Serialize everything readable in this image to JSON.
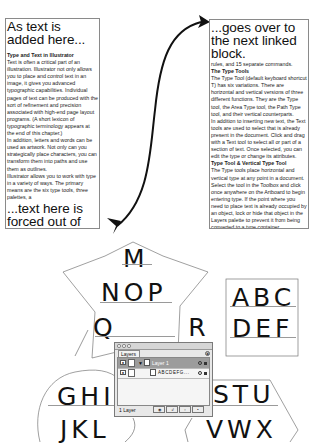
{
  "left_box": {
    "heading": "As text is added here...",
    "section_title": "Type and Text in Illustrator",
    "body": "Text is often a critical part of an illustration. Illustrator not only allows you to place and control text in an image, it gives you advanced typographic capabilities. Individual pages of text can be produced with the sort of refinement and precision associated with high-end page layout programs. (A short lexicon of typographic terminology appears at the end of this chapter.)",
    "body2": "In addition, letters and words can be used as artwork. Not only can you strategically place characters, you can transform them into paths and use them as outlines.",
    "body3": "Illustrator allows you to work with type in a variety of ways. The primary means are the six type tools, three palettes, a",
    "overflow": "...text here is forced out of the container and ..."
  },
  "right_box": {
    "heading": "...goes over to the next linked block.",
    "intro": "rules, and 15 separate commands.",
    "section1_title": "The Type Tools",
    "section1_body": "The Type Tool (default keyboard shortcut T) has six variations. There are horizontal and vertical versions of three different functions. They are the Type tool, the Area Type tool, the Path Type tool, and their vertical counterparts.",
    "section1_body2": "In addition to inserting new text, the Text tools are used to select that is already present in the document. Click and drag with a Text tool to select all or part of a section of text. Once selected, you can edit the type or change its attributes.",
    "section2_title": "Type Tool & Vertical Type Tool",
    "section2_body": "The Type tools place horizontal and vertical type at any point in a document. Select the tool in the Toolbox and click once anywhere on the Artboard to begin entering type. If the point where you need to place text is already occupied by an object, lock or hide that object in the Layers palette to prevent it from being converted to a type container."
  },
  "shapes": {
    "star": {
      "lines": [
        "M",
        "NOP",
        "Q      R"
      ]
    },
    "square": {
      "lines": [
        "ABC",
        "DEF"
      ]
    },
    "circle": {
      "lines": [
        "GHI",
        "JKL"
      ]
    },
    "pentagon": {
      "lines": [
        "STU",
        "VWX"
      ]
    }
  },
  "layers_palette": {
    "tab_label": "Layers",
    "menu_icon": "palette-menu-icon",
    "layers": [
      {
        "name": "Layer 1",
        "selected": true,
        "expanded": true
      },
      {
        "name": "ABCDEFG...",
        "selected": false,
        "sublayer": true
      }
    ],
    "footer": {
      "count_label": "1 Layer",
      "buttons": [
        "make-clipping-mask",
        "create-sublayer",
        "create-layer",
        "delete-layer"
      ]
    }
  },
  "colors": {
    "text": "#111111",
    "border": "#8a8a8a",
    "selected_row": "#9c9c9c",
    "palette_bg": "#e8e8e8"
  }
}
